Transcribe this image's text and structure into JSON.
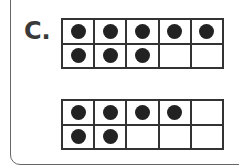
{
  "label": "C.",
  "frames": [
    {
      "cells": [
        1,
        1,
        1,
        1,
        1,
        1,
        1,
        1,
        0,
        0
      ],
      "count": 8
    },
    {
      "cells": [
        1,
        1,
        1,
        1,
        0,
        1,
        1,
        0,
        0,
        0
      ],
      "count": 6
    }
  ]
}
